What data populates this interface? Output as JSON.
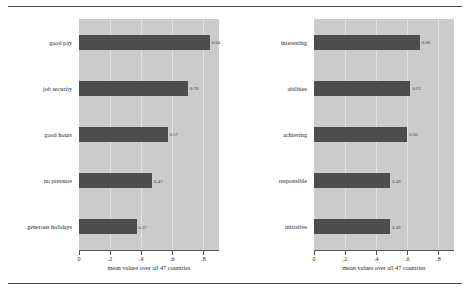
{
  "chart_data": [
    {
      "type": "bar",
      "orientation": "horizontal",
      "panel": "left",
      "title": "",
      "xlabel": "mean values over all 47 countries",
      "ylabel": "",
      "xlim": [
        0,
        0.9
      ],
      "xticks": [
        "0",
        ".2",
        ".4",
        ".6",
        ".8"
      ],
      "xtickvalues": [
        0,
        0.2,
        0.4,
        0.6,
        0.8
      ],
      "grid": true,
      "categories": [
        "generous holidays",
        "no pressure",
        "good hours",
        "job security",
        "good pay"
      ],
      "values": [
        0.37,
        0.47,
        0.57,
        0.7,
        0.84
      ],
      "value_labels": [
        "0.37",
        "0.47",
        "0.57",
        "0.70",
        "0.84"
      ],
      "bar_color": "#4d4d4d",
      "plot_background": "#cbcbcb"
    },
    {
      "type": "bar",
      "orientation": "horizontal",
      "panel": "right",
      "title": "",
      "xlabel": "mean values over all 47 countries",
      "ylabel": "",
      "xlim": [
        0,
        0.9
      ],
      "xticks": [
        "0",
        ".2",
        ".4",
        ".6",
        ".8"
      ],
      "xtickvalues": [
        0,
        0.2,
        0.4,
        0.6,
        0.8
      ],
      "grid": true,
      "categories": [
        "initiative",
        "responsible",
        "achieving",
        "abilities",
        "interesting"
      ],
      "values": [
        0.49,
        0.49,
        0.6,
        0.62,
        0.68
      ],
      "value_labels": [
        "0.49",
        "0.49",
        "0.60",
        "0.62",
        "0.68"
      ],
      "bar_color": "#4d4d4d",
      "plot_background": "#cbcbcb"
    }
  ]
}
